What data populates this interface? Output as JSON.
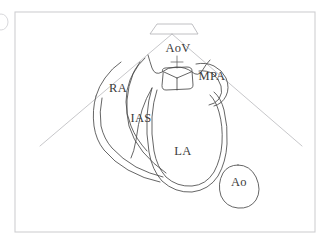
{
  "figure": {
    "modality": "echocardiogram-line-drawing",
    "background_color": "#ffffff",
    "frame": {
      "name": "figure-border",
      "color": "#cfcfd2",
      "x": 15,
      "y": 12,
      "width": 300,
      "height": 220
    },
    "sector": {
      "name": "ultrasound-sector-fan",
      "color": "#b9b9bd",
      "apex_x": 172,
      "apex_y": 34,
      "left_end_x": 40,
      "left_end_y": 146,
      "right_end_x": 302,
      "right_end_y": 146
    },
    "transducer": {
      "name": "transducer-footprint",
      "color": "#b0b0b4",
      "shape": "trapezoid",
      "top_left_x": 157,
      "top_right_x": 192,
      "top_y": 24,
      "bottom_left_x": 150,
      "bottom_right_x": 198,
      "bottom_y": 34
    },
    "stroke_color": "#4a4a4a",
    "label_color": "#3b3b3b"
  },
  "labels": [
    {
      "id": "aov",
      "text": "AoV",
      "x": 178,
      "y": 52,
      "anchor": "middle",
      "structure": "aortic-valve"
    },
    {
      "id": "mpa",
      "text": "MPA",
      "x": 212,
      "y": 80,
      "anchor": "middle",
      "structure": "main-pulmonary-artery"
    },
    {
      "id": "ra",
      "text": "RA",
      "x": 118,
      "y": 92,
      "anchor": "middle",
      "structure": "right-atrium"
    },
    {
      "id": "ias",
      "text": "IAS",
      "x": 141,
      "y": 122,
      "anchor": "middle",
      "structure": "interatrial-septum"
    },
    {
      "id": "la",
      "text": "LA",
      "x": 183,
      "y": 155,
      "anchor": "middle",
      "structure": "left-atrium"
    },
    {
      "id": "ao",
      "text": "Ao",
      "x": 239,
      "y": 186,
      "anchor": "middle",
      "structure": "descending-aorta"
    }
  ],
  "structures": {
    "aortic_valve": {
      "name": "aortic-valve-trefoil",
      "outline": "M 163,72 Q 161,69 165,68 L 187,67 Q 192,67 192,71 L 193,85 Q 193,89 188,89 L 166,90 Q 162,90 162,86 Z",
      "leaflet_lines": [
        "M 177,78 L 177,90",
        "M 177,78 L 163,72",
        "M 177,78 L 192,72"
      ],
      "crosshair": {
        "cx": 177,
        "cy": 62,
        "half": 6
      }
    },
    "aortic_root_wings": {
      "name": "aortic-root-wings",
      "path": "M 148,55 Q 150,62 152,68 Q 155,76 162,72 Q 168,67 176,67 Q 186,67 192,72 Q 198,77 202,71 Q 206,64 210,60"
    },
    "mpa_outflow": {
      "name": "mpa-outflow-tract",
      "outer": "M 196,64 Q 206,62 214,66 Q 222,70 226,78 Q 230,88 226,96 Q 222,104 214,106",
      "inner": "M 199,71 Q 207,70 213,74 Q 219,79 221,86 Q 223,93 219,99 Q 215,104 209,105"
    },
    "left_atrium": {
      "name": "left-atrium-chamber",
      "outer": "M 152,88 Q 148,100 147,116 Q 146,134 149,152 Q 152,170 162,181 Q 175,193 192,192 Q 209,190 218,176 Q 226,162 227,144 Q 228,126 224,110 Q 221,98 214,92",
      "inner": "M 157,90 Q 153,102 152,117 Q 151,134 154,151 Q 157,167 166,177 Q 177,187 192,186 Q 206,185 214,172 Q 221,159 222,143 Q 223,126 219,112 Q 216,101 210,95"
    },
    "right_atrium": {
      "name": "right-atrium-chamber",
      "outer": "M 145,58 Q 138,64 133,74 Q 128,86 127,100 Q 126,114 129,126 Q 133,140 143,152 Q 153,164 166,173",
      "inner": "M 140,62 Q 134,70 130,80 Q 126,90 126,102 Q 126,114 131,126 Q 136,139 147,151"
    },
    "ias_septum": {
      "name": "interatrial-septum",
      "path": "M 152,88 Q 146,98 142,110 Q 138,124 136,140 Q 134,152 131,158"
    },
    "ra_vessel": {
      "name": "right-atrial-venous-channel",
      "outer": "M 96,96 Q 92,110 94,126 Q 96,140 104,150 Q 114,162 128,170 Q 144,179 160,182",
      "inner": "M 102,98 Q 99,112 101,126 Q 104,139 112,148 Q 122,159 136,167 Q 150,174 163,177"
    },
    "ra_upper_wall": {
      "name": "right-atrium-upper-wall",
      "path": "M 96,96 Q 99,86 105,78 Q 112,68 121,62"
    },
    "descending_aorta": {
      "name": "descending-aorta-oval",
      "path": "M 238,165 Q 250,165 256,177 Q 262,190 256,200 Q 250,209 238,208 Q 226,207 221,196 Q 217,184 223,173 Q 228,165 238,165 Z"
    }
  },
  "corner_mark": {
    "name": "partial-edge-mark",
    "x": 1,
    "y": 14,
    "rx": 7,
    "ry": 8,
    "color": "#d4d4d7"
  }
}
